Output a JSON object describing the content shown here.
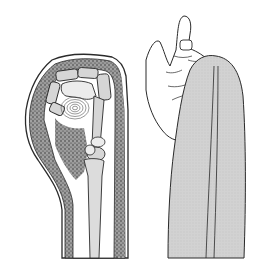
{
  "figure": {
    "panels": [
      {
        "id": "left",
        "subject": "cross-section-of-cast-on-hand-and-forearm"
      },
      {
        "id": "right",
        "subject": "external-view-of-hand-in-cast"
      }
    ]
  },
  "colors": {
    "background": "#ffffff",
    "outline": "#2a2a2a",
    "stipple_fill": "#8a8a8a",
    "stipple_dark": "#3a3a3a",
    "bone_fill": "#d6d6d6",
    "bone_light": "#ececec",
    "cast_fill": "#cfcfcf",
    "skin_fill": "#ffffff"
  }
}
